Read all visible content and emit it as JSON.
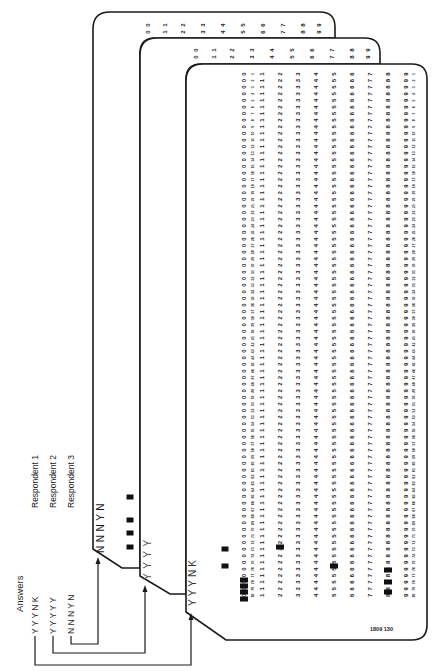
{
  "figure": {
    "answers_title": "Answers",
    "respondents": [
      {
        "name": "Respondent 1",
        "answers": [
          "Y",
          "Y",
          "Y",
          "N",
          "K"
        ],
        "answers_text": "Y  Y  Y  N  K"
      },
      {
        "name": "Respondent 2",
        "answers": [
          "Y",
          "Y",
          "Y",
          "Y",
          "Y"
        ],
        "answers_text": "Y  Y  Y  Y  Y"
      },
      {
        "name": "Respondent 3",
        "answers": [
          "N",
          "N",
          "N",
          "Y",
          "N"
        ],
        "answers_text": "N  N  N  Y  N"
      }
    ],
    "cards": [
      {
        "id": "back",
        "respondent": "Respondent 3",
        "printed_answers": "NNNYN"
      },
      {
        "id": "middle",
        "respondent": "Respondent 2",
        "printed_answers": "YYYY"
      },
      {
        "id": "front",
        "respondent": "Respondent 1",
        "printed_answers": "YYYNK",
        "serial": "1809 130"
      }
    ],
    "card_digits": [
      "0",
      "1",
      "2",
      "3",
      "4",
      "5",
      "6",
      "7",
      "8",
      "9"
    ],
    "colors": {
      "ink": "#1a1a1a",
      "paper": "#ffffff",
      "punch": "#111111"
    }
  }
}
